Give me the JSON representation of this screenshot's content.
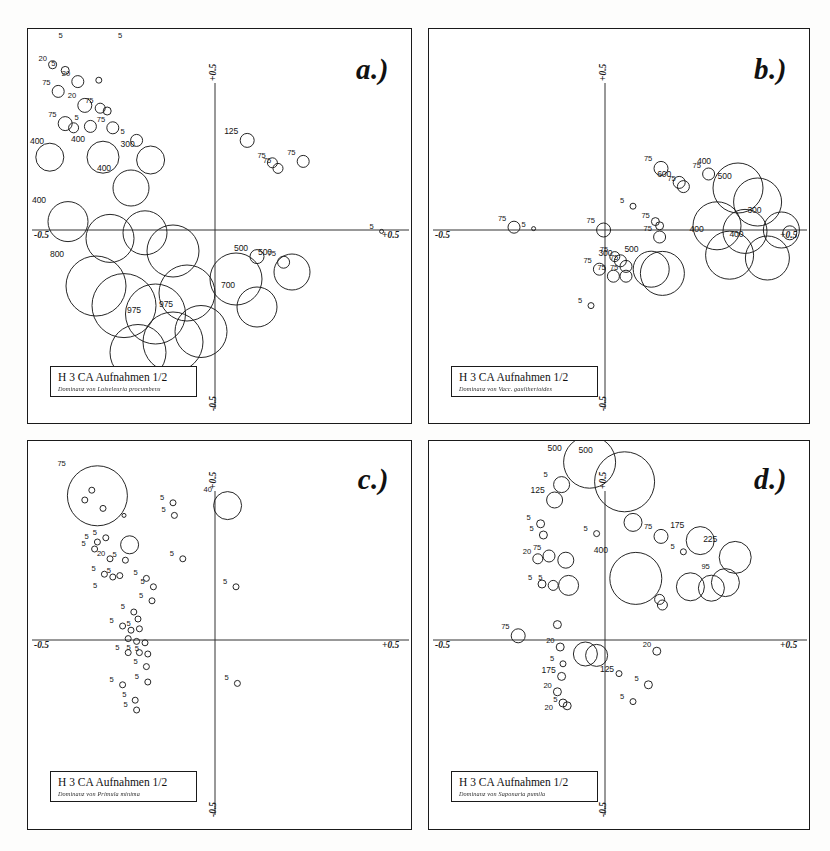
{
  "figure": {
    "kind": "scanned-figure",
    "panel_count": 4,
    "background": "#fdfdfc",
    "ink_color": "#1a1a1a"
  },
  "panels": [
    {
      "id": "a",
      "letter": "a.)",
      "legend_title": "H 3 CA Aufnahmen 1/2",
      "legend_sub": "Dominanz von Loiseleuria procumbens",
      "axes": {
        "x_min": "-0.5",
        "x_max": "+0.5",
        "y_max": "+0.5",
        "y_min": "-0.5"
      }
    },
    {
      "id": "b",
      "letter": "b.)",
      "legend_title": "H 3 CA Aufnahmen 1/2",
      "legend_sub": "Dominanz von Vacc. gaultherioides",
      "axes": {
        "x_min": "-0.5",
        "x_max": "+0.5",
        "y_max": "+0.5",
        "y_min": "-0.5"
      }
    },
    {
      "id": "c",
      "letter": "c.)",
      "legend_title": "H 3 CA Aufnahmen 1/2",
      "legend_sub": "Dominanz von Primula minima",
      "axes": {
        "x_min": "-0.5",
        "x_max": "+0.5",
        "y_max": "+0.5",
        "y_min": "-0.5"
      }
    },
    {
      "id": "d",
      "letter": "d.)",
      "legend_title": "H 3 CA Aufnahmen 1/2",
      "legend_sub": "Dominanz von Saponaria pumila",
      "axes": {
        "x_min": "-0.5",
        "x_max": "+0.5",
        "y_max": "+0.5",
        "y_min": "-0.5"
      }
    }
  ],
  "chart_data": [
    {
      "type": "scatter",
      "panel": "a",
      "title": "H 3 CA Aufnahmen 1/2",
      "subtitle": "Dominanz von Loiseleuria procumbens",
      "xlabel": "CA axis 1",
      "ylabel": "CA axis 2",
      "xlim": [
        -0.5,
        0.5
      ],
      "ylim": [
        -0.5,
        0.5
      ],
      "grid": false,
      "legend": "none",
      "marker": "open-circle",
      "size_encodes": "abundance / cover value",
      "points": [
        {
          "x": -0.205,
          "y": 0.33,
          "r": 3,
          "label": "5"
        },
        {
          "x": -0.12,
          "y": 0.295,
          "r": 3,
          "label": "5"
        },
        {
          "x": -0.232,
          "y": 0.236,
          "r": 4,
          "label": "20"
        },
        {
          "x": -0.214,
          "y": 0.228,
          "r": 4,
          "label": "5"
        },
        {
          "x": -0.196,
          "y": 0.212,
          "r": 6,
          "label": "20"
        },
        {
          "x": -0.166,
          "y": 0.214,
          "r": 3,
          "label": ""
        },
        {
          "x": -0.224,
          "y": 0.198,
          "r": 6,
          "label": "75"
        },
        {
          "x": -0.186,
          "y": 0.178,
          "r": 7,
          "label": "20"
        },
        {
          "x": -0.164,
          "y": 0.174,
          "r": 5,
          "label": "75"
        },
        {
          "x": -0.154,
          "y": 0.17,
          "r": 4,
          "label": ""
        },
        {
          "x": -0.214,
          "y": 0.152,
          "r": 7,
          "label": "75"
        },
        {
          "x": -0.202,
          "y": 0.146,
          "r": 5,
          "label": ""
        },
        {
          "x": -0.178,
          "y": 0.148,
          "r": 6,
          "label": "5"
        },
        {
          "x": -0.146,
          "y": 0.146,
          "r": 6,
          "label": "75"
        },
        {
          "x": -0.112,
          "y": 0.128,
          "r": 6,
          "label": "5"
        },
        {
          "x": -0.236,
          "y": 0.104,
          "r": 14,
          "label": "400"
        },
        {
          "x": -0.16,
          "y": 0.104,
          "r": 16,
          "label": "400"
        },
        {
          "x": -0.092,
          "y": 0.1,
          "r": 14,
          "label": "300"
        },
        {
          "x": 0.046,
          "y": 0.128,
          "r": 7,
          "label": "125"
        },
        {
          "x": 0.082,
          "y": 0.096,
          "r": 5,
          "label": "75"
        },
        {
          "x": 0.09,
          "y": 0.088,
          "r": 5,
          "label": "75"
        },
        {
          "x": 0.126,
          "y": 0.098,
          "r": 6,
          "label": "75"
        },
        {
          "x": -0.12,
          "y": 0.06,
          "r": 18,
          "label": "400"
        },
        {
          "x": -0.21,
          "y": 0.012,
          "r": 20,
          "label": "400"
        },
        {
          "x": -0.15,
          "y": -0.012,
          "r": 24,
          "label": ""
        },
        {
          "x": -0.1,
          "y": -0.004,
          "r": 22,
          "label": ""
        },
        {
          "x": -0.06,
          "y": -0.03,
          "r": 26,
          "label": ""
        },
        {
          "x": 0.238,
          "y": -0.002,
          "r": 2,
          "label": "5"
        },
        {
          "x": 0.06,
          "y": -0.038,
          "r": 7,
          "label": "500"
        },
        {
          "x": 0.098,
          "y": -0.046,
          "r": 6,
          "label": "75"
        },
        {
          "x": -0.17,
          "y": -0.08,
          "r": 30,
          "label": "800"
        },
        {
          "x": -0.13,
          "y": -0.108,
          "r": 32,
          "label": ""
        },
        {
          "x": -0.085,
          "y": -0.12,
          "r": 30,
          "label": ""
        },
        {
          "x": -0.04,
          "y": -0.09,
          "r": 28,
          "label": ""
        },
        {
          "x": 0.03,
          "y": -0.07,
          "r": 26,
          "label": ""
        },
        {
          "x": 0.11,
          "y": -0.06,
          "r": 18,
          "label": "500"
        },
        {
          "x": 0.06,
          "y": -0.11,
          "r": 20,
          "label": "700"
        },
        {
          "x": -0.06,
          "y": -0.16,
          "r": 30,
          "label": "975"
        },
        {
          "x": -0.02,
          "y": -0.145,
          "r": 26,
          "label": "975"
        },
        {
          "x": -0.11,
          "y": -0.175,
          "r": 28,
          "label": ""
        }
      ]
    },
    {
      "type": "scatter",
      "panel": "b",
      "title": "H 3 CA Aufnahmen 1/2",
      "subtitle": "Dominanz von Vacc. gaultherioides",
      "xlabel": "CA axis 1",
      "ylabel": "CA axis 2",
      "xlim": [
        -0.5,
        0.5
      ],
      "ylim": [
        -0.5,
        0.5
      ],
      "grid": false,
      "legend": "none",
      "marker": "open-circle",
      "size_encodes": "abundance / cover value",
      "points": [
        {
          "x": 0.08,
          "y": 0.088,
          "r": 7,
          "label": "75"
        },
        {
          "x": 0.106,
          "y": 0.068,
          "r": 6,
          "label": "600"
        },
        {
          "x": 0.112,
          "y": 0.062,
          "r": 6,
          "label": "75"
        },
        {
          "x": 0.148,
          "y": 0.08,
          "r": 6,
          "label": "75"
        },
        {
          "x": 0.19,
          "y": 0.06,
          "r": 25,
          "label": "400"
        },
        {
          "x": 0.218,
          "y": 0.04,
          "r": 24,
          "label": "500"
        },
        {
          "x": 0.04,
          "y": 0.034,
          "r": 3,
          "label": "5"
        },
        {
          "x": 0.072,
          "y": 0.012,
          "r": 4,
          "label": "75"
        },
        {
          "x": 0.078,
          "y": 0.006,
          "r": 4,
          "label": ""
        },
        {
          "x": 0.16,
          "y": 0.006,
          "r": 24,
          "label": ""
        },
        {
          "x": 0.2,
          "y": -0.002,
          "r": 22,
          "label": ""
        },
        {
          "x": 0.252,
          "y": 0.0,
          "r": 18,
          "label": "300"
        },
        {
          "x": 0.264,
          "y": -0.004,
          "r": 7,
          "label": ""
        },
        {
          "x": -0.13,
          "y": 0.004,
          "r": 6,
          "label": "75"
        },
        {
          "x": -0.102,
          "y": 0.002,
          "r": 2,
          "label": "5"
        },
        {
          "x": -0.002,
          "y": 0.0,
          "r": 7,
          "label": "75"
        },
        {
          "x": 0.078,
          "y": -0.01,
          "r": 6,
          "label": "75"
        },
        {
          "x": 0.178,
          "y": -0.036,
          "r": 24,
          "label": "400"
        },
        {
          "x": 0.232,
          "y": -0.04,
          "r": 22,
          "label": "400"
        },
        {
          "x": 0.014,
          "y": -0.038,
          "r": 5,
          "label": "75"
        },
        {
          "x": 0.022,
          "y": -0.044,
          "r": 6,
          "label": "300"
        },
        {
          "x": 0.03,
          "y": -0.052,
          "r": 6,
          "label": "75"
        },
        {
          "x": -0.008,
          "y": -0.056,
          "r": 6,
          "label": "75"
        },
        {
          "x": 0.012,
          "y": -0.066,
          "r": 6,
          "label": "75"
        },
        {
          "x": 0.03,
          "y": -0.066,
          "r": 6,
          "label": "75"
        },
        {
          "x": 0.066,
          "y": -0.056,
          "r": 18,
          "label": ""
        },
        {
          "x": 0.082,
          "y": -0.062,
          "r": 22,
          "label": "500"
        },
        {
          "x": -0.02,
          "y": -0.108,
          "r": 3,
          "label": "5"
        }
      ]
    },
    {
      "type": "scatter",
      "panel": "c",
      "title": "H 3 CA Aufnahmen 1/2",
      "subtitle": "Dominanz von Primula minima",
      "xlabel": "CA axis 1",
      "ylabel": "CA axis 2",
      "xlim": [
        -0.5,
        0.5
      ],
      "ylim": [
        -0.5,
        0.5
      ],
      "grid": false,
      "legend": "none",
      "marker": "open-circle",
      "size_encodes": "abundance / cover value",
      "points": [
        {
          "x": -0.168,
          "y": 0.206,
          "r": 30,
          "label": "75"
        },
        {
          "x": -0.176,
          "y": 0.214,
          "r": 3,
          "label": ""
        },
        {
          "x": -0.186,
          "y": 0.2,
          "r": 3,
          "label": ""
        },
        {
          "x": -0.16,
          "y": 0.188,
          "r": 3,
          "label": ""
        },
        {
          "x": -0.13,
          "y": 0.178,
          "r": 2,
          "label": ""
        },
        {
          "x": -0.06,
          "y": 0.196,
          "r": 3,
          "label": "5"
        },
        {
          "x": -0.058,
          "y": 0.178,
          "r": 3,
          "label": "5"
        },
        {
          "x": 0.018,
          "y": 0.192,
          "r": 14,
          "label": "40"
        },
        {
          "x": -0.168,
          "y": 0.14,
          "r": 3,
          "label": "5"
        },
        {
          "x": -0.156,
          "y": 0.146,
          "r": 3,
          "label": "5"
        },
        {
          "x": -0.172,
          "y": 0.13,
          "r": 3,
          "label": "5"
        },
        {
          "x": -0.122,
          "y": 0.136,
          "r": 9,
          "label": ""
        },
        {
          "x": -0.15,
          "y": 0.116,
          "r": 3,
          "label": "20"
        },
        {
          "x": -0.128,
          "y": 0.114,
          "r": 3,
          "label": "5"
        },
        {
          "x": -0.046,
          "y": 0.116,
          "r": 3,
          "label": "5"
        },
        {
          "x": -0.158,
          "y": 0.094,
          "r": 3,
          "label": "5"
        },
        {
          "x": -0.146,
          "y": 0.09,
          "r": 3,
          "label": ""
        },
        {
          "x": -0.136,
          "y": 0.092,
          "r": 3,
          "label": "5"
        },
        {
          "x": -0.098,
          "y": 0.088,
          "r": 3,
          "label": "5"
        },
        {
          "x": -0.088,
          "y": 0.076,
          "r": 3,
          "label": "5"
        },
        {
          "x": 0.03,
          "y": 0.076,
          "r": 3,
          "label": "5"
        },
        {
          "x": -0.16,
          "y": 0.074,
          "r": 0,
          "label": "5"
        },
        {
          "x": -0.09,
          "y": 0.056,
          "r": 3,
          "label": "5"
        },
        {
          "x": -0.116,
          "y": 0.04,
          "r": 3,
          "label": "5"
        },
        {
          "x": -0.11,
          "y": 0.03,
          "r": 3,
          "label": ""
        },
        {
          "x": -0.132,
          "y": 0.02,
          "r": 3,
          "label": "5"
        },
        {
          "x": -0.12,
          "y": 0.014,
          "r": 3,
          "label": ""
        },
        {
          "x": -0.108,
          "y": 0.016,
          "r": 3,
          "label": "5"
        },
        {
          "x": -0.124,
          "y": 0.002,
          "r": 3,
          "label": ""
        },
        {
          "x": -0.112,
          "y": -0.002,
          "r": 3,
          "label": ""
        },
        {
          "x": -0.1,
          "y": -0.004,
          "r": 3,
          "label": ""
        },
        {
          "x": -0.124,
          "y": -0.018,
          "r": 3,
          "label": "5"
        },
        {
          "x": -0.108,
          "y": -0.018,
          "r": 3,
          "label": "5"
        },
        {
          "x": -0.096,
          "y": -0.02,
          "r": 3,
          "label": "5"
        },
        {
          "x": -0.098,
          "y": -0.038,
          "r": 3,
          "label": "5"
        },
        {
          "x": -0.132,
          "y": -0.064,
          "r": 3,
          "label": "5"
        },
        {
          "x": -0.096,
          "y": -0.06,
          "r": 3,
          "label": "5"
        },
        {
          "x": 0.032,
          "y": -0.062,
          "r": 3,
          "label": "5"
        },
        {
          "x": -0.114,
          "y": -0.086,
          "r": 3,
          "label": "5"
        },
        {
          "x": -0.112,
          "y": -0.1,
          "r": 3,
          "label": "5"
        }
      ]
    },
    {
      "type": "scatter",
      "panel": "d",
      "title": "H 3 CA Aufnahmen 1/2",
      "subtitle": "Dominanz von Saponaria pumila",
      "xlabel": "CA axis 1",
      "ylabel": "CA axis 2",
      "xlim": [
        -0.5,
        0.5
      ],
      "ylim": [
        -0.5,
        0.5
      ],
      "grid": false,
      "legend": "none",
      "marker": "open-circle",
      "size_encodes": "abundance / cover value",
      "points": [
        {
          "x": -0.022,
          "y": 0.254,
          "r": 26,
          "label": "500"
        },
        {
          "x": 0.028,
          "y": 0.226,
          "r": 30,
          "label": "500"
        },
        {
          "x": -0.062,
          "y": 0.222,
          "r": 8,
          "label": "5"
        },
        {
          "x": -0.072,
          "y": 0.2,
          "r": 8,
          "label": "125"
        },
        {
          "x": 0.04,
          "y": 0.168,
          "r": 9,
          "label": ""
        },
        {
          "x": -0.092,
          "y": 0.166,
          "r": 4,
          "label": "5"
        },
        {
          "x": -0.088,
          "y": 0.15,
          "r": 4,
          "label": "5"
        },
        {
          "x": -0.012,
          "y": 0.152,
          "r": 3,
          "label": "5"
        },
        {
          "x": 0.08,
          "y": 0.148,
          "r": 7,
          "label": "75"
        },
        {
          "x": 0.136,
          "y": 0.142,
          "r": 14,
          "label": "175"
        },
        {
          "x": 0.112,
          "y": 0.126,
          "r": 3,
          "label": "5"
        },
        {
          "x": -0.096,
          "y": 0.116,
          "r": 5,
          "label": "20"
        },
        {
          "x": -0.08,
          "y": 0.12,
          "r": 6,
          "label": "75"
        },
        {
          "x": -0.056,
          "y": 0.114,
          "r": 8,
          "label": ""
        },
        {
          "x": 0.186,
          "y": 0.118,
          "r": 16,
          "label": "225"
        },
        {
          "x": 0.044,
          "y": 0.088,
          "r": 26,
          "label": "400"
        },
        {
          "x": -0.09,
          "y": 0.08,
          "r": 4,
          "label": "5"
        },
        {
          "x": -0.074,
          "y": 0.078,
          "r": 5,
          "label": "5"
        },
        {
          "x": -0.052,
          "y": 0.078,
          "r": 10,
          "label": ""
        },
        {
          "x": 0.122,
          "y": 0.076,
          "r": 14,
          "label": ""
        },
        {
          "x": 0.152,
          "y": 0.074,
          "r": 13,
          "label": ""
        },
        {
          "x": 0.172,
          "y": 0.082,
          "r": 14,
          "label": "95"
        },
        {
          "x": 0.078,
          "y": 0.058,
          "r": 5,
          "label": ""
        },
        {
          "x": 0.082,
          "y": 0.05,
          "r": 5,
          "label": ""
        },
        {
          "x": -0.124,
          "y": 0.006,
          "r": 7,
          "label": "75"
        },
        {
          "x": -0.068,
          "y": 0.022,
          "r": 4,
          "label": ""
        },
        {
          "x": -0.064,
          "y": -0.01,
          "r": 4,
          "label": "20"
        },
        {
          "x": -0.028,
          "y": -0.02,
          "r": 12,
          "label": ""
        },
        {
          "x": -0.012,
          "y": -0.022,
          "r": 11,
          "label": ""
        },
        {
          "x": 0.074,
          "y": -0.016,
          "r": 4,
          "label": "20"
        },
        {
          "x": -0.06,
          "y": -0.034,
          "r": 3,
          "label": "5"
        },
        {
          "x": -0.062,
          "y": -0.052,
          "r": 4,
          "label": "175"
        },
        {
          "x": 0.02,
          "y": -0.048,
          "r": 3,
          "label": "125"
        },
        {
          "x": 0.062,
          "y": -0.064,
          "r": 4,
          "label": "5"
        },
        {
          "x": -0.068,
          "y": -0.074,
          "r": 4,
          "label": "20"
        },
        {
          "x": -0.06,
          "y": -0.09,
          "r": 4,
          "label": ""
        },
        {
          "x": -0.054,
          "y": -0.094,
          "r": 4,
          "label": "5"
        },
        {
          "x": 0.04,
          "y": -0.088,
          "r": 3,
          "label": "5"
        },
        {
          "x": -0.072,
          "y": -0.1,
          "r": 0,
          "label": "20"
        }
      ]
    }
  ]
}
